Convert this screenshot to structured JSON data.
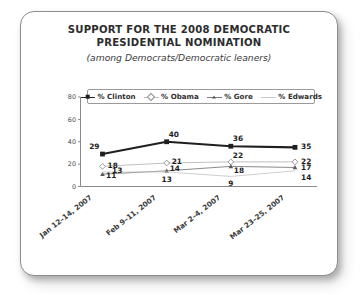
{
  "chart_data": {
    "type": "line",
    "title": "SUPPORT FOR THE 2008 DEMOCRATIC PRESIDENTIAL NOMINATION",
    "title_line1": "SUPPORT FOR THE 2008 DEMOCRATIC",
    "title_line2": "PRESIDENTIAL NOMINATION",
    "subtitle": "(among Democrats/Democratic leaners)",
    "xlabel": "",
    "ylabel": "",
    "ylim": [
      0,
      80
    ],
    "yticks": [
      0,
      20,
      40,
      60,
      80
    ],
    "ytick_labels": [
      "0",
      "20",
      "40",
      "60",
      "80"
    ],
    "grid": false,
    "legend_position": "top",
    "categories": [
      "Jan 12–14, 2007",
      "Feb 9–11, 2007",
      "Mar 2–4, 2007",
      "Mar 23–25, 2007"
    ],
    "series": [
      {
        "name": "% Clinton",
        "marker": "filled-square",
        "color": "#1f1f1f",
        "values": [
          29,
          40,
          36,
          35
        ],
        "labels": [
          "29",
          "40",
          "36",
          "35"
        ]
      },
      {
        "name": "% Obama",
        "marker": "open-diamond",
        "color": "#b9b9b9",
        "values": [
          18,
          21,
          22,
          22
        ],
        "labels": [
          "18",
          "21",
          "22",
          "22"
        ]
      },
      {
        "name": "% Gore",
        "marker": "triangle",
        "color": "#7d7d7d",
        "values": [
          11,
          14,
          18,
          17
        ],
        "labels": [
          "11",
          "14",
          "18",
          "17"
        ]
      },
      {
        "name": "% Edwards",
        "marker": "none",
        "color": "#c9c9c9",
        "values": [
          13,
          13,
          9,
          14
        ],
        "labels": [
          "13",
          "13",
          "9",
          "14"
        ]
      }
    ]
  },
  "legend": {
    "items": [
      {
        "label": "% Clinton"
      },
      {
        "label": "% Obama"
      },
      {
        "label": "% Gore"
      },
      {
        "label": "% Edwards"
      }
    ]
  }
}
